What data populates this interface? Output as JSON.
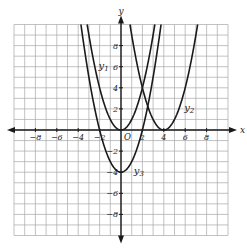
{
  "chart_data": {
    "type": "line",
    "title": "",
    "xlabel": "x",
    "ylabel": "y",
    "xlim": [
      -10,
      10
    ],
    "ylim": [
      -10,
      10
    ],
    "grid": true,
    "grid_step": 1,
    "x_ticks": [
      -8,
      -6,
      -4,
      -2,
      2,
      4,
      6,
      8
    ],
    "y_ticks": [
      -8,
      -6,
      -4,
      -2,
      2,
      4,
      6,
      8
    ],
    "x_tick_labels": [
      "−8",
      "−6",
      "−4",
      "−2",
      "2",
      "4",
      "6",
      "8"
    ],
    "y_tick_labels": [
      "−8",
      "−6",
      "−4",
      "−2",
      "2",
      "4",
      "6",
      "8"
    ],
    "origin_label": "O",
    "series": [
      {
        "name": "y1",
        "label_main": "y",
        "label_sub": "1",
        "equation": "x^2",
        "a": 1,
        "h": 0,
        "k": 0,
        "label_pos": [
          -2.1,
          6.1
        ]
      },
      {
        "name": "y2",
        "label_main": "y",
        "label_sub": "2",
        "equation": "(x-4)^2",
        "a": 1,
        "h": 4,
        "k": 0,
        "label_pos": [
          5.9,
          2.1
        ]
      },
      {
        "name": "y3",
        "label_main": "y",
        "label_sub": "3",
        "equation": "x^2-4",
        "a": 1,
        "h": 0,
        "k": -4,
        "label_pos": [
          1.2,
          -3.9
        ]
      }
    ],
    "colors": {
      "curve": "#1a1a1a",
      "grid": "#a8a8a8",
      "axis": "#1a1a1a"
    }
  }
}
